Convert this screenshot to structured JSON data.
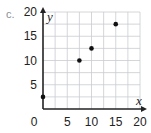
{
  "problem_label": "c.",
  "chart_data": {
    "type": "scatter",
    "title": "",
    "xlabel": "x",
    "ylabel": "y",
    "xlim": [
      0,
      20
    ],
    "ylim": [
      0,
      20
    ],
    "grid": true,
    "grid_step": 2.5,
    "x_ticks": [
      0,
      5,
      10,
      15,
      20
    ],
    "y_ticks": [
      5,
      10,
      15,
      20
    ],
    "x_tick_labels": [
      "0",
      "5",
      "10",
      "15",
      "20"
    ],
    "y_tick_labels": [
      "5",
      "10",
      "15",
      "20"
    ],
    "points": [
      {
        "x": 0,
        "y": 2.5
      },
      {
        "x": 7.5,
        "y": 10
      },
      {
        "x": 10,
        "y": 12.5
      },
      {
        "x": 15,
        "y": 17.5
      }
    ],
    "point_color": "#111111"
  }
}
